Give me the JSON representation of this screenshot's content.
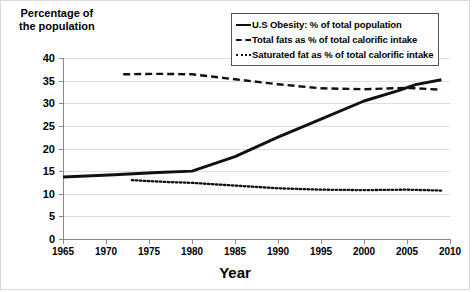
{
  "chart_data": {
    "type": "line",
    "title": "",
    "xlabel": "Year",
    "ylabel": "Percentage of the population",
    "ylabel_line1": "Percentage of",
    "ylabel_line2": "the population",
    "xlim": [
      1965,
      2010
    ],
    "ylim": [
      0,
      40
    ],
    "xticks": [
      1965,
      1970,
      1975,
      1980,
      1985,
      1990,
      1995,
      2000,
      2005,
      2010
    ],
    "yticks": [
      0,
      5,
      10,
      15,
      20,
      25,
      30,
      35,
      40
    ],
    "grid": "horizontal",
    "legend_position": "top-right",
    "series": [
      {
        "name": "U.S Obesity: % of total population",
        "style": "solid",
        "color": "#111111",
        "x": [
          1965,
          1971,
          1976,
          1980,
          1985,
          1990,
          1995,
          2000,
          2004,
          2006,
          2009
        ],
        "values": [
          13.7,
          14.2,
          14.7,
          15.0,
          18.2,
          22.5,
          26.5,
          30.5,
          32.8,
          34.1,
          35.2
        ]
      },
      {
        "name": "Total fats as % of total calorific intake",
        "style": "dashed",
        "color": "#111111",
        "x": [
          1972,
          1976,
          1980,
          1985,
          1990,
          1995,
          2000,
          2005,
          2009
        ],
        "values": [
          36.4,
          36.5,
          36.4,
          35.3,
          34.2,
          33.3,
          33.1,
          33.4,
          33.0
        ]
      },
      {
        "name": "Saturated fat as % of total calorific intake",
        "style": "dotted",
        "color": "#111111",
        "x": [
          1973,
          1977,
          1980,
          1985,
          1990,
          1995,
          2000,
          2005,
          2009
        ],
        "values": [
          13.0,
          12.6,
          12.4,
          11.8,
          11.2,
          10.9,
          10.8,
          10.9,
          10.7
        ]
      }
    ]
  },
  "legend": {
    "items": [
      {
        "label": "U.S Obesity: % of total population",
        "key": "solid-line-key"
      },
      {
        "label": "Total fats as % of total calorific intake",
        "key": "dashed-line-key"
      },
      {
        "label": "Saturated fat as % of total calorific intake",
        "key": "dotted-line-key"
      }
    ]
  }
}
